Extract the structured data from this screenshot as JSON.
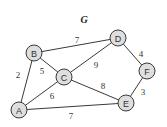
{
  "title": "G",
  "nodes": [
    {
      "id": "A",
      "label": "A",
      "x": 19,
      "y": 110
    },
    {
      "id": "B",
      "label": "B",
      "x": 34,
      "y": 53
    },
    {
      "id": "C",
      "label": "C",
      "x": 64,
      "y": 77
    },
    {
      "id": "D",
      "label": "D",
      "x": 118,
      "y": 38
    },
    {
      "id": "E",
      "label": "E",
      "x": 126,
      "y": 103
    },
    {
      "id": "F",
      "label": "F",
      "x": 147,
      "y": 71
    }
  ],
  "edges": [
    {
      "from": "A",
      "to": "B",
      "weight": "2",
      "lx": 18,
      "ly": 75
    },
    {
      "from": "B",
      "to": "C",
      "weight": "5",
      "lx": 42,
      "ly": 71
    },
    {
      "from": "B",
      "to": "D",
      "weight": "7",
      "lx": 77,
      "ly": 40
    },
    {
      "from": "A",
      "to": "C",
      "weight": "6",
      "lx": 52,
      "ly": 96
    },
    {
      "from": "C",
      "to": "D",
      "weight": "9",
      "lx": 96,
      "ly": 65
    },
    {
      "from": "C",
      "to": "E",
      "weight": "8",
      "lx": 103,
      "ly": 86
    },
    {
      "from": "A",
      "to": "E",
      "weight": "7",
      "lx": 71,
      "ly": 116
    },
    {
      "from": "D",
      "to": "F",
      "weight": "4",
      "lx": 141,
      "ly": 54
    },
    {
      "from": "E",
      "to": "F",
      "weight": "3",
      "lx": 143,
      "ly": 92
    }
  ]
}
